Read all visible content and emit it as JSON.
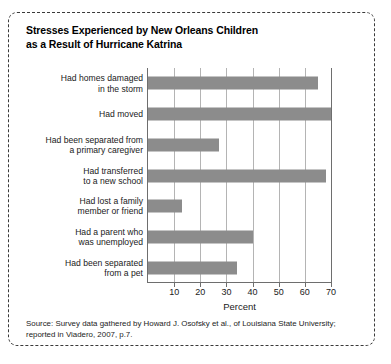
{
  "figure": {
    "title_lines": [
      "Stresses Experienced by New Orleans Children",
      "as a Result of Hurricane Katrina"
    ],
    "source_lines": [
      "Source: Survey data gathered by Howard J. Osofsky et al., of Louisiana State University;",
      "reported in Viadero, 2007, p.7."
    ],
    "bar_color": "#8c8c8c",
    "grid_color": "#b4b4b4",
    "axis_color": "#6e6e6e"
  },
  "chart_data": {
    "type": "bar",
    "orientation": "horizontal",
    "title": "Stresses Experienced by New Orleans Children as a Result of Hurricane Katrina",
    "xlabel": "Percent",
    "ylabel": "",
    "xlim": [
      0,
      70
    ],
    "xticks": [
      10,
      20,
      30,
      40,
      50,
      60,
      70
    ],
    "xticklabels": [
      "10",
      "20",
      "30",
      "40",
      "50",
      "60",
      "70"
    ],
    "grid": "vertical",
    "legend": "none",
    "categories": [
      "Had homes damaged in the storm",
      "Had moved",
      "Had been separated from a primary caregiver",
      "Had transferred to a new school",
      "Had lost a family member or friend",
      "Had a parent who was unemployed",
      "Had been separated from a pet"
    ],
    "category_lines": [
      [
        "Had homes damaged",
        "in the storm"
      ],
      [
        "Had moved"
      ],
      [
        "Had been separated from",
        "a primary caregiver"
      ],
      [
        "Had transferred",
        "to a new school"
      ],
      [
        "Had lost a family",
        "member or friend"
      ],
      [
        "Had a parent who",
        "was unemployed"
      ],
      [
        "Had been separated",
        "from a pet"
      ]
    ],
    "values": [
      65,
      70,
      27,
      68,
      13,
      40,
      34
    ]
  }
}
